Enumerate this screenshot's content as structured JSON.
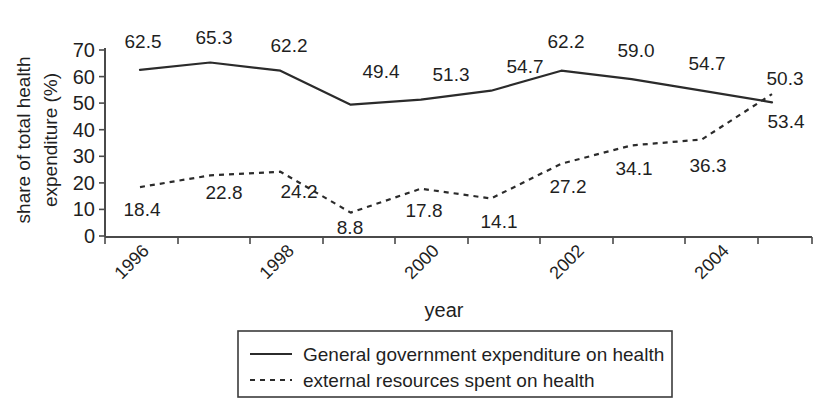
{
  "chart_data": {
    "type": "line",
    "title": "",
    "xlabel": "year",
    "ylabel": "share of total health expenditure (%)",
    "ylabel_line1": "share of total health",
    "ylabel_line2": "expenditure (%)",
    "x": [
      1996,
      1997,
      1998,
      1999,
      2000,
      2001,
      2002,
      2003,
      2004,
      2005
    ],
    "categories": [
      "1996",
      "1997",
      "1998",
      "1999",
      "2000",
      "2001",
      "2002",
      "2003",
      "2004",
      "2005"
    ],
    "xtick_labels": [
      "1996",
      "1998",
      "2000",
      "2002",
      "2004"
    ],
    "xtick_values": [
      1996,
      1998,
      2000,
      2002,
      2004
    ],
    "ytick_labels": [
      "0",
      "10",
      "20",
      "30",
      "40",
      "50",
      "60",
      "70"
    ],
    "ytick_values": [
      0,
      10,
      20,
      30,
      40,
      50,
      60,
      70
    ],
    "ylim": [
      0,
      70
    ],
    "xlim": [
      1995.5,
      2005.5
    ],
    "grid": false,
    "legend_position": "bottom",
    "series": [
      {
        "name": "General government expenditure on health",
        "style": "solid",
        "color": "#2b2b2b",
        "values": [
          62.5,
          65.3,
          62.2,
          49.4,
          51.3,
          54.7,
          62.2,
          59.0,
          54.7,
          50.3
        ],
        "data_labels": [
          "62.5",
          "65.3",
          "62.2",
          "49.4",
          "51.3",
          "54.7",
          "62.2",
          "59.0",
          "54.7",
          "50.3"
        ],
        "label_side": "above"
      },
      {
        "name": "external resources spent on health",
        "style": "dashed",
        "color": "#2b2b2b",
        "values": [
          18.4,
          22.8,
          24.2,
          8.8,
          17.8,
          14.1,
          27.2,
          34.1,
          36.3,
          53.4
        ],
        "data_labels": [
          "18.4",
          "22.8",
          "24.2",
          "8.8",
          "17.8",
          "14.1",
          "27.2",
          "34.1",
          "36.3",
          "53.4"
        ],
        "label_side": "below"
      }
    ]
  },
  "legend": {
    "items": [
      {
        "label": "General government expenditure on health",
        "style": "solid"
      },
      {
        "label": "external resources spent on health",
        "style": "dashed"
      }
    ]
  },
  "colors": {
    "line": "#2b2b2b",
    "axis": "#4a4a4a",
    "text": "#1f1f1f",
    "background": "#ffffff",
    "legend_border": "#3b3b3b"
  }
}
